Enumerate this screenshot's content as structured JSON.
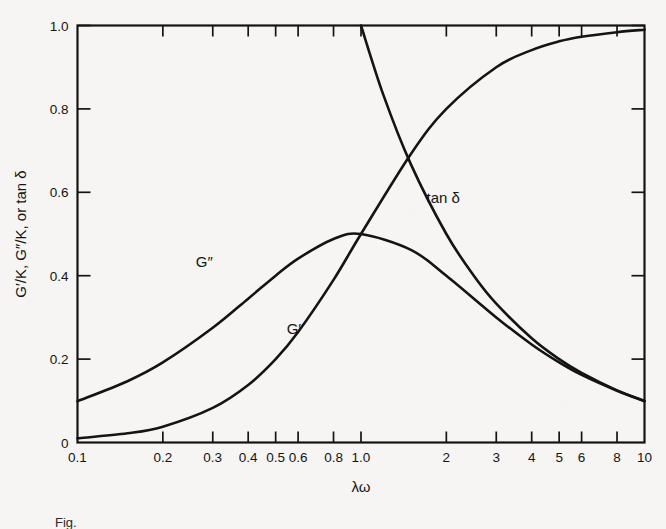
{
  "chart_data": {
    "type": "line",
    "title": "",
    "xlabel": "λω",
    "ylabel": "G′/K, G″/K, or tan δ",
    "xscale": "log",
    "yscale": "linear",
    "xlim": [
      0.1,
      10
    ],
    "ylim": [
      0,
      1.0
    ],
    "grid": false,
    "legend": "inline-curve-labels",
    "x_tick_labels": [
      "0.1",
      "0.2",
      "0.3",
      "0.4",
      "0.5",
      "0.6",
      "0.8",
      "1.0",
      "2",
      "3",
      "4",
      "5",
      "6",
      "8",
      "10"
    ],
    "x_tick_values": [
      0.1,
      0.2,
      0.3,
      0.4,
      0.5,
      0.6,
      0.8,
      1.0,
      2,
      3,
      4,
      5,
      6,
      8,
      10
    ],
    "y_tick_labels": [
      "0",
      "0.2",
      "0.4",
      "0.6",
      "0.8",
      "1.0"
    ],
    "y_tick_values": [
      0,
      0.2,
      0.4,
      0.6,
      0.8,
      1.0
    ],
    "series": [
      {
        "name": "G′/K",
        "label": "G′",
        "formula": "(λω)^2 / (1 + (λω)^2)",
        "x": [
          0.1,
          0.15,
          0.2,
          0.3,
          0.4,
          0.5,
          0.6,
          0.8,
          1.0,
          1.5,
          2,
          3,
          4,
          5,
          6,
          8,
          10
        ],
        "y": [
          0.01,
          0.022,
          0.038,
          0.083,
          0.138,
          0.2,
          0.265,
          0.39,
          0.5,
          0.692,
          0.8,
          0.9,
          0.941,
          0.962,
          0.973,
          0.984,
          0.99
        ]
      },
      {
        "name": "G″/K",
        "label": "G″",
        "formula": "λω / (1 + (λω)^2)",
        "x": [
          0.1,
          0.15,
          0.2,
          0.3,
          0.4,
          0.5,
          0.6,
          0.8,
          1.0,
          1.5,
          2,
          3,
          4,
          5,
          6,
          8,
          10
        ],
        "y": [
          0.099,
          0.147,
          0.192,
          0.275,
          0.345,
          0.4,
          0.441,
          0.488,
          0.5,
          0.462,
          0.4,
          0.3,
          0.235,
          0.192,
          0.162,
          0.124,
          0.099
        ]
      },
      {
        "name": "tan δ",
        "label": "tan δ",
        "formula": "1 / (λω)",
        "x": [
          1.0,
          1.2,
          1.5,
          2,
          2.5,
          3,
          4,
          5,
          6,
          8,
          10
        ],
        "y": [
          1.0,
          0.833,
          0.667,
          0.5,
          0.4,
          0.333,
          0.25,
          0.2,
          0.167,
          0.125,
          0.1
        ]
      }
    ],
    "annotations": [
      {
        "text": "G″",
        "x": 0.28,
        "y": 0.42
      },
      {
        "text": "G′",
        "x": 0.58,
        "y": 0.26
      },
      {
        "text": "tan δ",
        "x": 1.95,
        "y": 0.575
      }
    ]
  },
  "figure": {
    "caption": "Fig."
  }
}
